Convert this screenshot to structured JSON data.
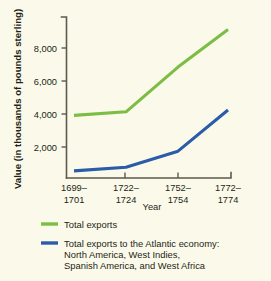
{
  "chart_data": {
    "type": "line",
    "title": "",
    "xlabel": "Year",
    "ylabel": "Value (in thousands of pounds sterling)",
    "categories": [
      "1699-\n1701",
      "1722-\n1724",
      "1752-\n1754",
      "1772-\n1774"
    ],
    "category_lines": [
      [
        "1699–",
        "1701"
      ],
      [
        "1722–",
        "1724"
      ],
      [
        "1752–",
        "1754"
      ],
      [
        "1772–",
        "1774"
      ]
    ],
    "ylim": [
      0,
      9000
    ],
    "yticks": [
      2000,
      4000,
      6000,
      8000
    ],
    "ytick_labels": [
      "2,000",
      "4,000",
      "6,000",
      "8,000"
    ],
    "grid": false,
    "legend_position": "below",
    "series": [
      {
        "name": "Total exports",
        "color": "#7cbd45",
        "values": [
          3500,
          3700,
          6200,
          8300
        ]
      },
      {
        "name": "Total exports to the Atlantic economy: North America, West Indies, Spanish America, and West Africa",
        "color": "#2a5ca8",
        "values": [
          400,
          600,
          1500,
          3800
        ]
      }
    ]
  },
  "legend": {
    "entries": [
      {
        "color": "#7cbd45",
        "lines": [
          "Total exports"
        ]
      },
      {
        "color": "#2a5ca8",
        "lines": [
          "Total exports to the Atlantic economy:",
          "North America, West Indies,",
          "Spanish America, and West Africa"
        ]
      }
    ]
  },
  "colors": {
    "background": "#fbfaea",
    "axis": "#5c5a4e",
    "text": "#231f17",
    "green_series": "#7cbd45",
    "blue_series": "#2a5ca8"
  }
}
